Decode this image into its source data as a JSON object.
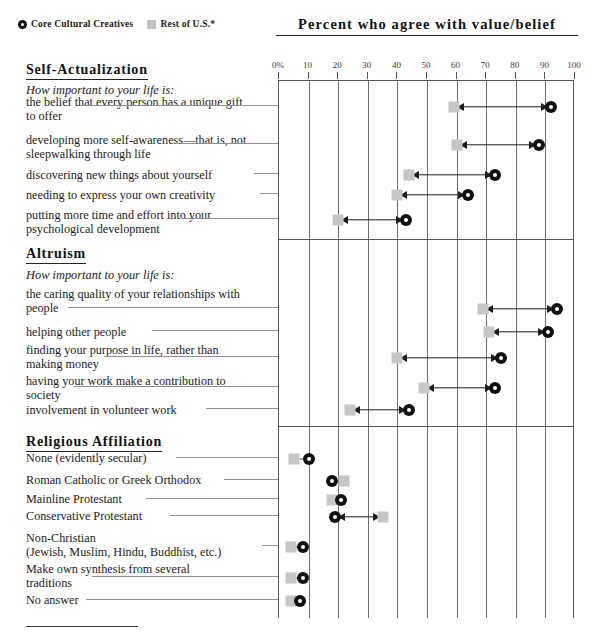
{
  "legend": {
    "items": [
      {
        "glyph": "circle-marker-icon",
        "label": "Core Cultural Creatives"
      },
      {
        "glyph": "square-marker-icon",
        "label": "Rest of U.S.*"
      }
    ]
  },
  "chart_data": {
    "type": "scatter",
    "title": "Percent who agree with value/belief",
    "xlabel": "",
    "ylabel": "",
    "xlim": [
      0,
      100
    ],
    "grid": true,
    "legend_position": "top-left",
    "tick_labels": [
      "0%",
      "10",
      "20",
      "30",
      "40",
      "50",
      "60",
      "70",
      "80",
      "90",
      "100"
    ],
    "ticks": [
      0,
      10,
      20,
      30,
      40,
      50,
      60,
      70,
      80,
      90,
      100
    ],
    "series": [
      {
        "name": "Core Cultural Creatives",
        "marker": "circle"
      },
      {
        "name": "Rest of U.S.*",
        "marker": "square"
      }
    ],
    "sections": [
      {
        "heading": "Self-Actualization",
        "subheading": "How important to your life is:",
        "rows": [
          {
            "label": "the belief that every person has a unique gift to offer",
            "lines": [
              "the belief that every person has a unique gift",
              "to offer"
            ],
            "core": 92,
            "rest": 59
          },
          {
            "label": "developing more self-awareness—that is, not sleepwalking through life",
            "lines": [
              "developing more self-awareness—that is, not",
              "sleepwalking through life"
            ],
            "core": 88,
            "rest": 60
          },
          {
            "label": "discovering new things about yourself",
            "lines": [
              "discovering new things about yourself"
            ],
            "core": 73,
            "rest": 44
          },
          {
            "label": "needing to express your own creativity",
            "lines": [
              "needing to express your own creativity"
            ],
            "core": 64,
            "rest": 40
          },
          {
            "label": "putting more time and effort into your psychological development",
            "lines": [
              "putting more time and effort into your",
              "psychological development"
            ],
            "core": 43,
            "rest": 20
          }
        ]
      },
      {
        "heading": "Altruism",
        "subheading": "How important to your life is:",
        "rows": [
          {
            "label": "the caring quality of your relationships with people",
            "lines": [
              "the caring quality of your relationships with",
              "people"
            ],
            "core": 94,
            "rest": 69
          },
          {
            "label": "helping other people",
            "lines": [
              "helping other people"
            ],
            "core": 91,
            "rest": 71
          },
          {
            "label": "finding your purpose in life, rather than making money",
            "lines": [
              "finding your purpose in life, rather than",
              "making money"
            ],
            "core": 75,
            "rest": 40
          },
          {
            "label": "having your work make a contribution to society",
            "lines": [
              "having your work make a contribution to",
              "society"
            ],
            "core": 73,
            "rest": 49
          },
          {
            "label": "involvement in volunteer work",
            "lines": [
              "involvement in volunteer work"
            ],
            "core": 44,
            "rest": 24
          }
        ]
      },
      {
        "heading": "Religious Affiliation",
        "subheading": "",
        "rows": [
          {
            "label": "None (evidently secular)",
            "lines": [
              "None (evidently secular)"
            ],
            "core": 10,
            "rest": 5
          },
          {
            "label": "Roman Catholic or Greek Orthodox",
            "lines": [
              "Roman Catholic or Greek Orthodox"
            ],
            "core": 18,
            "rest": 22
          },
          {
            "label": "Mainline Protestant",
            "lines": [
              "Mainline Protestant"
            ],
            "core": 21,
            "rest": 18
          },
          {
            "label": "Conservative Protestant",
            "lines": [
              "Conservative Protestant"
            ],
            "core": 19,
            "rest": 35
          },
          {
            "label": "Non-Christian (Jewish, Muslim, Hindu, Buddhist, etc.)",
            "lines": [
              "Non-Christian",
              "(Jewish, Muslim, Hindu, Buddhist, etc.)"
            ],
            "core": 8,
            "rest": 4
          },
          {
            "label": "Make own synthesis from several traditions",
            "lines": [
              "Make own synthesis from several",
              "traditions"
            ],
            "core": 8,
            "rest": 4
          },
          {
            "label": "No answer",
            "lines": [
              "No answer"
            ],
            "core": 7,
            "rest": 4
          }
        ]
      }
    ]
  }
}
